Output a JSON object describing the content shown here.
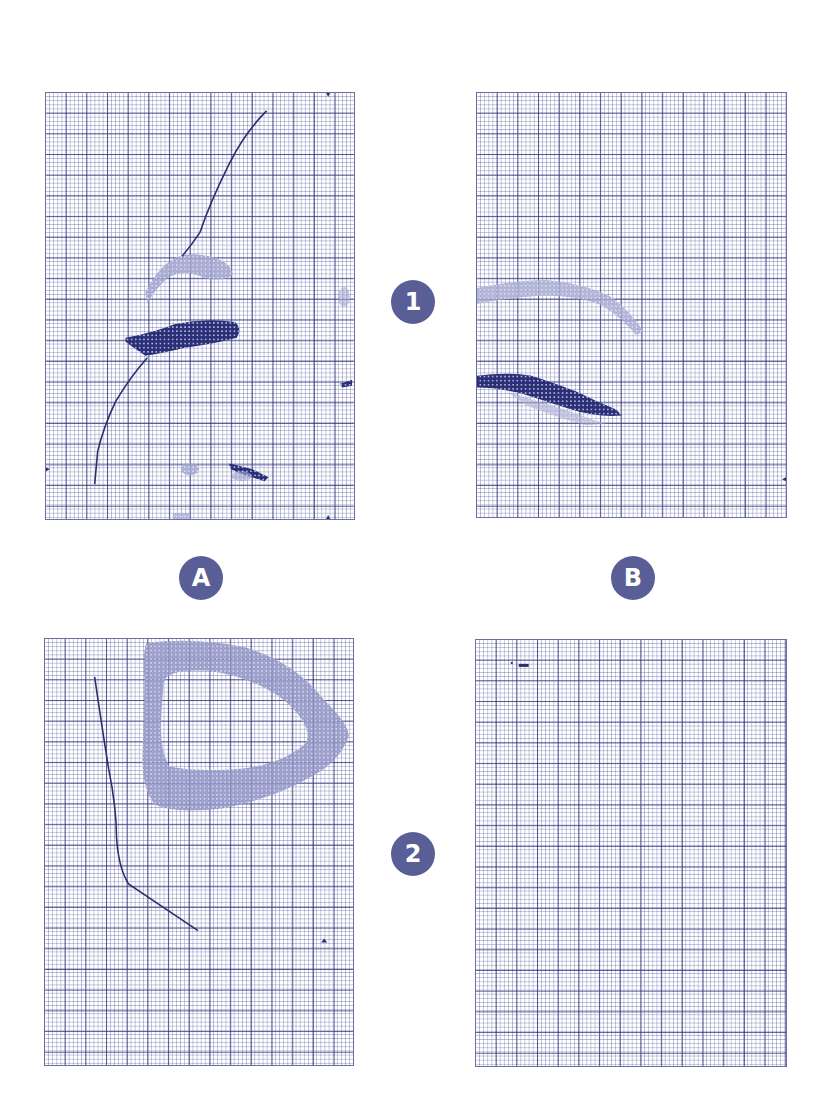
{
  "figure": {
    "layout": "2x2 grid of graph-paper panels",
    "row_labels": [
      "1",
      "2"
    ],
    "column_labels": [
      "A",
      "B"
    ],
    "colors": {
      "badge": "#5a5e97",
      "badge_text": "#ffffff",
      "grid_major": "#30347a",
      "grid_minor": "#8a8ec0",
      "dark_fill": "#23286e",
      "light_fill": "#9a9ec8",
      "trace_line": "#2a2e6e"
    }
  },
  "badges": {
    "row_1": "1",
    "row_2": "2",
    "col_a": "A",
    "col_b": "B"
  },
  "panels": [
    {
      "id": "1A",
      "row": "1",
      "col": "A",
      "contents": [
        "curved trace line",
        "light arc region",
        "dark horizontal blob",
        "small dark streak",
        "light speckles"
      ]
    },
    {
      "id": "1B",
      "row": "1",
      "col": "B",
      "contents": [
        "light arc band",
        "dark diagonal blob"
      ]
    },
    {
      "id": "2A",
      "row": "2",
      "col": "A",
      "contents": [
        "bent trace line",
        "light ring-shaped region",
        "small marker"
      ]
    },
    {
      "id": "2B",
      "row": "2",
      "col": "B",
      "contents": [
        "small dark mark near top-left"
      ]
    }
  ]
}
